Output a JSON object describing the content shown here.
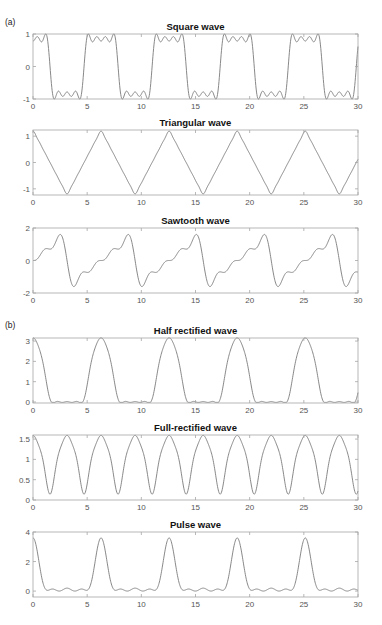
{
  "figure": {
    "labels": [
      "(a)",
      "(b)"
    ],
    "line_color": "#7a7a7a",
    "frame_color": "#a6a6a6"
  },
  "chart_data": [
    {
      "type": "line",
      "group": "(a)",
      "title": "Square wave",
      "xlabel": "",
      "ylabel": "",
      "xlim": [
        0,
        30
      ],
      "ylim": [
        -1,
        1
      ],
      "xticks": [
        0,
        5,
        10,
        15,
        20,
        25,
        30
      ],
      "yticks": [
        -1,
        0,
        1
      ],
      "ytick_labels": [
        "-1",
        "0",
        "1"
      ],
      "grid": false,
      "series": [
        {
          "name": "square",
          "formula": "sum_{k=0..3} (-1)^k cos((2k+1)x)/(2k+1) * 1.08",
          "period": 6.283
        }
      ],
      "description": "Truncated Fourier series of square wave, ripples on plateaus near ±0.8, peaks ~±0.93"
    },
    {
      "type": "line",
      "group": "(a)",
      "title": "Triangular wave",
      "xlabel": "",
      "ylabel": "",
      "xlim": [
        0,
        30
      ],
      "ylim": [
        -1.234,
        1.234
      ],
      "xticks": [
        0,
        5,
        10,
        15,
        20,
        25,
        30
      ],
      "yticks": [
        -1,
        0,
        1
      ],
      "ytick_labels": [
        "-1",
        "0",
        "1"
      ],
      "grid": false,
      "series": [
        {
          "name": "triangular",
          "formula": "sum_{k=0..5} cos((2k+1)x)/(2k+1)^2",
          "period": 6.283
        }
      ],
      "description": "Peaks ~1.2 at 0, 2π, 4π...; troughs ~-1.2 at π, 3π..."
    },
    {
      "type": "line",
      "group": "(a)",
      "title": "Sawtooth wave",
      "xlabel": "",
      "ylabel": "",
      "xlim": [
        0,
        30
      ],
      "ylim": [
        -2,
        2
      ],
      "xticks": [
        0,
        5,
        10,
        15,
        20,
        25,
        30
      ],
      "yticks": [
        -2,
        0,
        2
      ],
      "ytick_labels": [
        "-2",
        "0",
        "2"
      ],
      "grid": false,
      "series": [
        {
          "name": "sawtooth",
          "formula": "sum_{k=1..4} (-1)^(k+1) sin(kx)/k",
          "period": 6.283
        }
      ],
      "description": "Rising staircase from -1.5 to 1.5 then sharp drop; peaks ~1.5"
    },
    {
      "type": "line",
      "group": "(b)",
      "title": "Half rectified wave",
      "xlabel": "",
      "ylabel": "",
      "xlim": [
        0,
        30
      ],
      "ylim": [
        -0.05,
        3.15
      ],
      "xticks": [
        0,
        5,
        10,
        15,
        20,
        25,
        30
      ],
      "yticks": [
        0,
        1,
        2,
        3
      ],
      "ytick_labels": [
        "0",
        "1",
        "2",
        "3"
      ],
      "grid": false,
      "series": [
        {
          "name": "half_rectified",
          "formula": "(pi/2)cos x + 1 + (2/3)cos2x - (2/15)cos4x + (2/35)cos6x - 0.14*? (approx)",
          "period": 6.283
        }
      ],
      "description": "Peaks ~3.14 at 0, 2π...; near-zero flat between"
    },
    {
      "type": "line",
      "group": "(b)",
      "title": "Full-rectified wave",
      "xlabel": "",
      "ylabel": "",
      "xlim": [
        0,
        30
      ],
      "ylim": [
        0,
        1.6
      ],
      "xticks": [
        0,
        5,
        10,
        15,
        20,
        25,
        30
      ],
      "yticks": [
        0,
        0.5,
        1,
        1.5
      ],
      "ytick_labels": [
        "0",
        "0.5",
        "1",
        "1.5"
      ],
      "grid": false,
      "series": [
        {
          "name": "full_rectified",
          "formula": "1 + (2/3)cos2x - (2/15)cos4x + (2/35)cos6x",
          "period": 3.1416
        }
      ],
      "description": "Peaks ~1.57 every π; minima ~0.15 at π/2 + kπ"
    },
    {
      "type": "line",
      "group": "(b)",
      "title": "Pulse wave",
      "xlabel": "",
      "ylabel": "",
      "xlim": [
        0,
        30
      ],
      "ylim": [
        -0.4,
        4
      ],
      "xticks": [
        0,
        5,
        10,
        15,
        20,
        25,
        30
      ],
      "yticks": [
        0,
        2,
        4
      ],
      "ytick_labels": [
        "0",
        "2",
        "4"
      ],
      "grid": false,
      "series": [
        {
          "name": "pulse",
          "formula": "0.75 + 1.2cos x + 0.9cos2x + 0.5cos3x + 0.25cos4x",
          "period": 6.283
        }
      ],
      "description": "Main lobes ~3.6 at 0, 2π...; two small side bumps ~0.3 between; minima ~-0.35"
    }
  ]
}
